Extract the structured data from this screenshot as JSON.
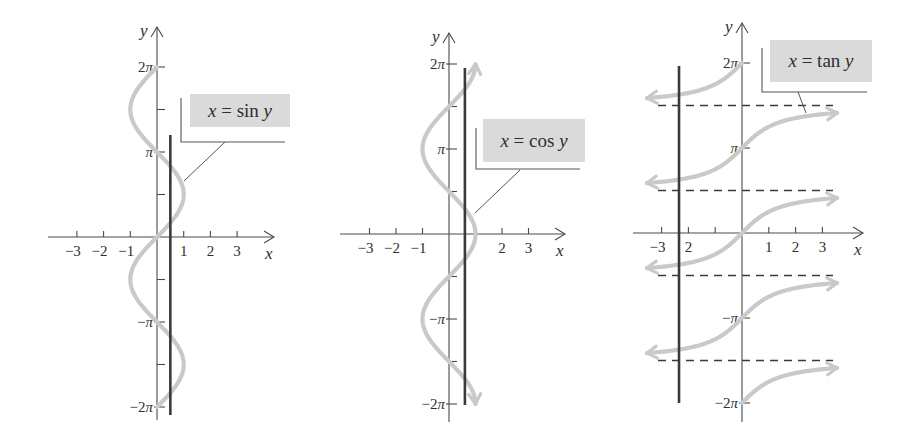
{
  "chart_data": [
    {
      "type": "line",
      "title": "",
      "equation_label": {
        "var": "x",
        "eq": "=",
        "fn": "sin",
        "arg": "y"
      },
      "function": "sin",
      "xlabel": "x",
      "ylabel": "y",
      "x_ticks": [
        -3,
        -2,
        -1,
        1,
        2,
        3
      ],
      "x_tick_labels": [
        "−3",
        "−2",
        "−1",
        "1",
        "2",
        "3"
      ],
      "y_ticks_pi_multiples": [
        -2,
        -1.5,
        -1,
        -0.5,
        0.5,
        1,
        1.5,
        2
      ],
      "y_tick_labels": {
        "2": "2π",
        "1": "π",
        "-1": "−π",
        "-2": "−2π"
      },
      "y_range_pi": [
        -2,
        2
      ],
      "curve_arrows": false,
      "vertical_line_x": 0.5,
      "vertical_line_y_px": [
        135,
        415
      ],
      "series": [
        {
          "name": "x = sin y",
          "color": "#c9c9c9"
        }
      ],
      "layout": {
        "origin": [
          157,
          237
        ],
        "unit_x": 26.7,
        "pi_px": 85,
        "xaxis_px": [
          48,
          274
        ],
        "yaxis_px": [
          27,
          420
        ],
        "label_box": [
          190,
          94,
          100,
          33
        ],
        "bracket": [
          181,
          98,
          285,
          142
        ],
        "leader": [
          225,
          142,
          184,
          181
        ]
      }
    },
    {
      "type": "line",
      "title": "",
      "equation_label": {
        "var": "x",
        "eq": "=",
        "fn": "cos",
        "arg": "y"
      },
      "function": "cos",
      "xlabel": "x",
      "ylabel": "y",
      "x_ticks": [
        -3,
        -2,
        -1,
        1,
        2,
        3
      ],
      "x_tick_labels": [
        "−3",
        "−2",
        "−1",
        "",
        "2",
        "3"
      ],
      "y_ticks_pi_multiples": [
        -2,
        -1.5,
        -1,
        -0.5,
        0.5,
        1,
        1.5,
        2
      ],
      "y_tick_labels": {
        "2": "2π",
        "1": "π",
        "-1": "−π",
        "-2": "−2π"
      },
      "y_range_pi": [
        -2,
        2
      ],
      "curve_arrows": true,
      "vertical_line_x": 0.6,
      "vertical_line_y_px": [
        68,
        405
      ],
      "series": [
        {
          "name": "x = cos y",
          "color": "#c9c9c9"
        }
      ],
      "layout": {
        "origin": [
          449,
          234
        ],
        "unit_x": 26.5,
        "pi_px": 85,
        "xaxis_px": [
          340,
          565
        ],
        "yaxis_px": [
          33,
          422
        ],
        "label_box": [
          483,
          119,
          102,
          43
        ],
        "bracket": [
          476,
          128,
          580,
          169
        ],
        "leader": [
          520,
          170,
          475,
          213
        ]
      }
    },
    {
      "type": "line",
      "title": "",
      "equation_label": {
        "var": "x",
        "eq": "=",
        "fn": "tan",
        "arg": "y"
      },
      "function": "tan",
      "xlabel": "x",
      "ylabel": "y",
      "x_ticks": [
        -3,
        -2,
        -1,
        1,
        2,
        3
      ],
      "x_tick_labels": [
        "−3",
        "2",
        "",
        "1",
        "2",
        "3"
      ],
      "y_ticks_pi_multiples": [
        -2,
        -1,
        1,
        2
      ],
      "y_tick_labels": {
        "2": "2π",
        "1": "π",
        "-1": "−π",
        "-2": "−2π"
      },
      "y_range_pi": [
        -2,
        2
      ],
      "asymptotes_pi": [
        1.5,
        0.5,
        -0.5,
        -1.5
      ],
      "asymptote_x_px": [
        658,
        833
      ],
      "branches": [
        {
          "center_pi": 2,
          "y_from_pi": 1.5,
          "y_to_pi": 2,
          "arrow": "left"
        },
        {
          "center_pi": 1,
          "arrow": "both"
        },
        {
          "center_pi": 0,
          "arrow": "both"
        },
        {
          "center_pi": -1,
          "arrow": "both"
        },
        {
          "center_pi": -2,
          "y_from_pi": -2,
          "y_to_pi": -1.5,
          "arrow": "right"
        }
      ],
      "curve_arrows": true,
      "vertical_line_x": -2.35,
      "vertical_line_y_px": [
        66,
        403
      ],
      "series": [
        {
          "name": "x = tan y",
          "color": "#c9c9c9"
        }
      ],
      "layout": {
        "origin": [
          742,
          233
        ],
        "unit_x": 26.8,
        "pi_px": 85,
        "xaxis_px": [
          633,
          863
        ],
        "yaxis_px": [
          23,
          422
        ],
        "label_box": [
          770,
          40,
          102,
          42
        ],
        "bracket": [
          762,
          48,
          867,
          92
        ],
        "leader": [
          798,
          92,
          806,
          113
        ]
      }
    }
  ],
  "colors": {
    "curve": "#c9c9c9",
    "axis": "#4a4a4a",
    "vertical_line": "#3a3a3a",
    "label_box": "#dadada"
  }
}
